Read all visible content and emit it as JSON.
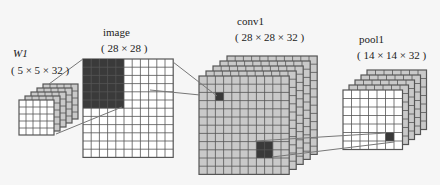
{
  "labels": {
    "w1_name": "W1",
    "w1_dims": "( 5 × 5 × 32 )",
    "image_name": "image",
    "image_dims": "( 28 × 28 )",
    "conv1_name": "conv1",
    "conv1_dims": "( 28 × 28 × 32 )",
    "pool1_name": "pool1",
    "pool1_dims": "( 14 × 14 × 32 )"
  },
  "colors": {
    "background": "#f6f6f6",
    "grid_line": "#555555",
    "white_cell": "#ffffff",
    "gray_cell": "#c9c9c9",
    "dark_cell": "#3a3a3a",
    "connector": "#777777"
  },
  "blocks": {
    "w1": {
      "x": 19,
      "y": 100,
      "cols": 5,
      "rows": 5,
      "cell": 7,
      "layers": 5,
      "dx": 6,
      "dy": -4,
      "front": "white"
    },
    "image": {
      "x": 83,
      "y": 59,
      "cols": 11,
      "rows": 12,
      "cell": 8.2,
      "layers": 1,
      "front": "white",
      "dark": {
        "c0": 0,
        "r0": 0,
        "cols": 5,
        "rows": 6
      }
    },
    "conv1": {
      "x": 199,
      "y": 76,
      "cols": 11,
      "rows": 12,
      "cell": 8.2,
      "layers": 5,
      "dx": 7,
      "dy": -5,
      "front": "gray",
      "dark": [
        {
          "c0": 2,
          "r0": 2,
          "cols": 1,
          "rows": 1
        },
        {
          "c0": 7,
          "r0": 8,
          "cols": 2,
          "rows": 2
        }
      ]
    },
    "pool1": {
      "x": 343,
      "y": 90,
      "cols": 7,
      "rows": 7,
      "cell": 8.5,
      "layers": 5,
      "dx": 6,
      "dy": -5,
      "front": "white",
      "dark": [
        {
          "c0": 5,
          "r0": 5,
          "cols": 1,
          "rows": 1
        }
      ]
    }
  },
  "connectors": [
    [
      49,
      84,
      83,
      59
    ],
    [
      56,
      134,
      122,
      107
    ],
    [
      173,
      62,
      217,
      96
    ],
    [
      150,
      90,
      200,
      95
    ],
    [
      255,
      141,
      386,
      133
    ],
    [
      272,
      157,
      394,
      142
    ]
  ]
}
